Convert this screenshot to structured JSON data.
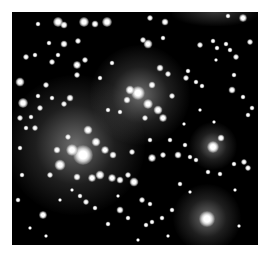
{
  "image": {
    "subject": "star cluster field (grayscale astronomical image)",
    "background_color": "#000000",
    "page_color": "#ffffff",
    "frame": {
      "left": 12,
      "top": 12,
      "width": 246,
      "height": 233
    }
  },
  "glows": [
    {
      "x": 75,
      "y": 145,
      "r": 70
    },
    {
      "x": 140,
      "y": 95,
      "r": 50
    },
    {
      "x": 207,
      "y": 218,
      "r": 34
    },
    {
      "x": 213,
      "y": 146,
      "r": 24
    }
  ],
  "stars": [
    {
      "x": 83,
      "y": 155,
      "s": 20
    },
    {
      "x": 72,
      "y": 150,
      "s": 12
    },
    {
      "x": 60,
      "y": 165,
      "s": 11
    },
    {
      "x": 96,
      "y": 142,
      "s": 9
    },
    {
      "x": 105,
      "y": 150,
      "s": 8
    },
    {
      "x": 88,
      "y": 130,
      "s": 9
    },
    {
      "x": 100,
      "y": 175,
      "s": 9
    },
    {
      "x": 92,
      "y": 178,
      "s": 8
    },
    {
      "x": 112,
      "y": 178,
      "s": 8
    },
    {
      "x": 77,
      "y": 177,
      "s": 7
    },
    {
      "x": 113,
      "y": 155,
      "s": 7
    },
    {
      "x": 57,
      "y": 150,
      "s": 7
    },
    {
      "x": 50,
      "y": 175,
      "s": 6
    },
    {
      "x": 68,
      "y": 137,
      "s": 6
    },
    {
      "x": 120,
      "y": 180,
      "s": 7
    },
    {
      "x": 134,
      "y": 182,
      "s": 9
    },
    {
      "x": 128,
      "y": 175,
      "s": 6
    },
    {
      "x": 138,
      "y": 93,
      "s": 14
    },
    {
      "x": 130,
      "y": 90,
      "s": 9
    },
    {
      "x": 148,
      "y": 104,
      "s": 10
    },
    {
      "x": 158,
      "y": 110,
      "s": 9
    },
    {
      "x": 163,
      "y": 118,
      "s": 8
    },
    {
      "x": 152,
      "y": 85,
      "s": 7
    },
    {
      "x": 127,
      "y": 100,
      "s": 7
    },
    {
      "x": 160,
      "y": 68,
      "s": 7
    },
    {
      "x": 168,
      "y": 74,
      "s": 6
    },
    {
      "x": 145,
      "y": 118,
      "s": 6
    },
    {
      "x": 172,
      "y": 96,
      "s": 6
    },
    {
      "x": 207,
      "y": 219,
      "s": 16
    },
    {
      "x": 213,
      "y": 147,
      "s": 12
    },
    {
      "x": 221,
      "y": 138,
      "s": 7
    },
    {
      "x": 58,
      "y": 22,
      "s": 10
    },
    {
      "x": 64,
      "y": 25,
      "s": 7
    },
    {
      "x": 84,
      "y": 22,
      "s": 10
    },
    {
      "x": 95,
      "y": 24,
      "s": 7
    },
    {
      "x": 107,
      "y": 22,
      "s": 10
    },
    {
      "x": 150,
      "y": 18,
      "s": 6
    },
    {
      "x": 165,
      "y": 22,
      "s": 7
    },
    {
      "x": 243,
      "y": 18,
      "s": 8
    },
    {
      "x": 228,
      "y": 16,
      "s": 5
    },
    {
      "x": 38,
      "y": 24,
      "s": 5
    },
    {
      "x": 64,
      "y": 44,
      "s": 7
    },
    {
      "x": 78,
      "y": 41,
      "s": 6
    },
    {
      "x": 49,
      "y": 43,
      "s": 5
    },
    {
      "x": 85,
      "y": 60,
      "s": 6
    },
    {
      "x": 77,
      "y": 65,
      "s": 8
    },
    {
      "x": 77,
      "y": 75,
      "s": 6
    },
    {
      "x": 58,
      "y": 55,
      "s": 5
    },
    {
      "x": 148,
      "y": 44,
      "s": 9
    },
    {
      "x": 143,
      "y": 40,
      "s": 6
    },
    {
      "x": 163,
      "y": 38,
      "s": 5
    },
    {
      "x": 200,
      "y": 45,
      "s": 6
    },
    {
      "x": 217,
      "y": 48,
      "s": 5
    },
    {
      "x": 226,
      "y": 44,
      "s": 5
    },
    {
      "x": 213,
      "y": 41,
      "s": 5
    },
    {
      "x": 230,
      "y": 50,
      "s": 5
    },
    {
      "x": 250,
      "y": 42,
      "s": 6
    },
    {
      "x": 236,
      "y": 57,
      "s": 6
    },
    {
      "x": 20,
      "y": 82,
      "s": 9
    },
    {
      "x": 23,
      "y": 103,
      "s": 10
    },
    {
      "x": 26,
      "y": 57,
      "s": 6
    },
    {
      "x": 35,
      "y": 55,
      "s": 5
    },
    {
      "x": 52,
      "y": 62,
      "s": 6
    },
    {
      "x": 46,
      "y": 85,
      "s": 6
    },
    {
      "x": 38,
      "y": 96,
      "s": 5
    },
    {
      "x": 52,
      "y": 98,
      "s": 5
    },
    {
      "x": 64,
      "y": 104,
      "s": 6
    },
    {
      "x": 70,
      "y": 98,
      "s": 7
    },
    {
      "x": 40,
      "y": 108,
      "s": 6
    },
    {
      "x": 20,
      "y": 118,
      "s": 6
    },
    {
      "x": 31,
      "y": 117,
      "s": 5
    },
    {
      "x": 35,
      "y": 128,
      "s": 6
    },
    {
      "x": 26,
      "y": 128,
      "s": 5
    },
    {
      "x": 20,
      "y": 148,
      "s": 5
    },
    {
      "x": 22,
      "y": 175,
      "s": 5
    },
    {
      "x": 43,
      "y": 215,
      "s": 8
    },
    {
      "x": 18,
      "y": 200,
      "s": 5
    },
    {
      "x": 30,
      "y": 228,
      "s": 4
    },
    {
      "x": 46,
      "y": 236,
      "s": 4
    },
    {
      "x": 86,
      "y": 202,
      "s": 6
    },
    {
      "x": 80,
      "y": 196,
      "s": 5
    },
    {
      "x": 95,
      "y": 208,
      "s": 5
    },
    {
      "x": 108,
      "y": 224,
      "s": 5
    },
    {
      "x": 120,
      "y": 210,
      "s": 7
    },
    {
      "x": 128,
      "y": 218,
      "s": 5
    },
    {
      "x": 142,
      "y": 200,
      "s": 6
    },
    {
      "x": 150,
      "y": 204,
      "s": 5
    },
    {
      "x": 152,
      "y": 222,
      "s": 5
    },
    {
      "x": 146,
      "y": 225,
      "s": 5
    },
    {
      "x": 162,
      "y": 218,
      "s": 5
    },
    {
      "x": 172,
      "y": 210,
      "s": 5
    },
    {
      "x": 168,
      "y": 236,
      "s": 4
    },
    {
      "x": 132,
      "y": 152,
      "s": 6
    },
    {
      "x": 152,
      "y": 158,
      "s": 8
    },
    {
      "x": 163,
      "y": 155,
      "s": 6
    },
    {
      "x": 178,
      "y": 155,
      "s": 7
    },
    {
      "x": 185,
      "y": 145,
      "s": 5
    },
    {
      "x": 190,
      "y": 157,
      "s": 5
    },
    {
      "x": 150,
      "y": 140,
      "s": 5
    },
    {
      "x": 170,
      "y": 140,
      "s": 5
    },
    {
      "x": 196,
      "y": 160,
      "s": 5
    },
    {
      "x": 234,
      "y": 164,
      "s": 5
    },
    {
      "x": 244,
      "y": 162,
      "s": 6
    },
    {
      "x": 248,
      "y": 168,
      "s": 6
    },
    {
      "x": 208,
      "y": 172,
      "s": 5
    },
    {
      "x": 220,
      "y": 174,
      "s": 5
    },
    {
      "x": 235,
      "y": 190,
      "s": 4
    },
    {
      "x": 239,
      "y": 226,
      "s": 4
    },
    {
      "x": 186,
      "y": 78,
      "s": 6
    },
    {
      "x": 196,
      "y": 82,
      "s": 5
    },
    {
      "x": 188,
      "y": 71,
      "s": 5
    },
    {
      "x": 202,
      "y": 86,
      "s": 5
    },
    {
      "x": 232,
      "y": 90,
      "s": 7
    },
    {
      "x": 243,
      "y": 97,
      "s": 5
    },
    {
      "x": 252,
      "y": 108,
      "s": 5
    },
    {
      "x": 248,
      "y": 115,
      "s": 5
    },
    {
      "x": 234,
      "y": 75,
      "s": 5
    },
    {
      "x": 216,
      "y": 60,
      "s": 4
    },
    {
      "x": 100,
      "y": 78,
      "s": 5
    },
    {
      "x": 112,
      "y": 63,
      "s": 5
    },
    {
      "x": 120,
      "y": 112,
      "s": 5
    },
    {
      "x": 108,
      "y": 110,
      "s": 5
    },
    {
      "x": 184,
      "y": 124,
      "s": 4
    },
    {
      "x": 200,
      "y": 110,
      "s": 4
    },
    {
      "x": 214,
      "y": 122,
      "s": 4
    },
    {
      "x": 180,
      "y": 184,
      "s": 5
    },
    {
      "x": 190,
      "y": 192,
      "s": 4
    },
    {
      "x": 60,
      "y": 200,
      "s": 4
    },
    {
      "x": 72,
      "y": 190,
      "s": 4
    },
    {
      "x": 118,
      "y": 196,
      "s": 4
    },
    {
      "x": 138,
      "y": 240,
      "s": 4
    }
  ]
}
